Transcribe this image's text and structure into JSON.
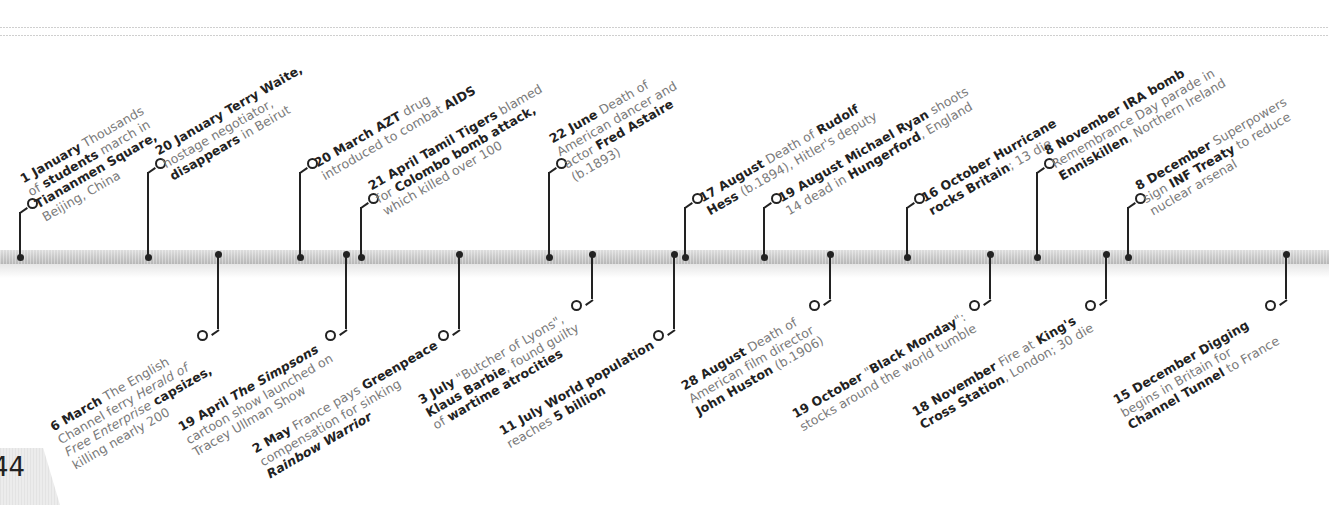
{
  "page": {
    "number": "44",
    "year_context": "1987"
  },
  "colors": {
    "band": "#c9c9c9",
    "pin": "#222222",
    "bold_text": "#222222",
    "body_text": "#7a7a7a"
  },
  "events_above": [
    {
      "date": "1 January",
      "lines": [
        [
          {
            "t": "1 January",
            "b": true
          },
          {
            "t": " Thousands"
          }
        ],
        [
          {
            "t": "of "
          },
          {
            "t": "students",
            "b": true
          },
          {
            "t": " march in"
          }
        ],
        [
          {
            "t": "Tiananmen Square,",
            "b": true
          }
        ],
        [
          {
            "t": "Beijing, China"
          }
        ]
      ],
      "x": 20
    },
    {
      "date": "20 January",
      "lines": [
        [
          {
            "t": "20 January Terry Waite,",
            "b": true
          }
        ],
        [
          {
            "t": "hostage negotiator,"
          }
        ],
        [
          {
            "t": "disappears",
            "b": true
          },
          {
            "t": " in Beirut"
          }
        ]
      ],
      "x": 148
    },
    {
      "date": "20 March",
      "lines": [
        [
          {
            "t": "20 March AZT",
            "b": true
          },
          {
            "t": " drug"
          }
        ],
        [
          {
            "t": "introduced to combat "
          },
          {
            "t": "AIDS",
            "b": true
          }
        ]
      ],
      "x": 300
    },
    {
      "date": "21 April",
      "lines": [
        [
          {
            "t": "21 April Tamil Tigers",
            "b": true
          },
          {
            "t": " blamed"
          }
        ],
        [
          {
            "t": "for "
          },
          {
            "t": "Colombo bomb attack,",
            "b": true
          }
        ],
        [
          {
            "t": "which killed over 100"
          }
        ]
      ],
      "x": 361
    },
    {
      "date": "22 June",
      "lines": [
        [
          {
            "t": "22 June",
            "b": true
          },
          {
            "t": " Death of"
          }
        ],
        [
          {
            "t": "American dancer and"
          }
        ],
        [
          {
            "t": "actor "
          },
          {
            "t": "Fred Astaire",
            "b": true
          }
        ],
        [
          {
            "t": "(b.1893)"
          }
        ]
      ],
      "x": 549
    },
    {
      "date": "17 August",
      "lines": [
        [
          {
            "t": "17 August",
            "b": true
          },
          {
            "t": " Death of "
          },
          {
            "t": "Rudolf",
            "b": true
          }
        ],
        [
          {
            "t": "Hess",
            "b": true
          },
          {
            "t": " (b.1894), Hitler's deputy"
          }
        ]
      ],
      "x": 685
    },
    {
      "date": "19 August",
      "lines": [
        [
          {
            "t": "19 August Michael Ryan",
            "b": true
          },
          {
            "t": " shoots"
          }
        ],
        [
          {
            "t": "14 dead in "
          },
          {
            "t": "Hungerford",
            "b": true
          },
          {
            "t": ", England"
          }
        ]
      ],
      "x": 764
    },
    {
      "date": "16 October",
      "lines": [
        [
          {
            "t": "16 October Hurricane",
            "b": true
          }
        ],
        [
          {
            "t": "rocks Britain",
            "b": true
          },
          {
            "t": "; 13 die"
          }
        ]
      ],
      "x": 907
    },
    {
      "date": "8 November",
      "lines": [
        [
          {
            "t": "8 November IRA bomb",
            "b": true
          }
        ],
        [
          {
            "t": "Remembrance Day parade in"
          }
        ],
        [
          {
            "t": "Enniskillen",
            "b": true
          },
          {
            "t": ", Northern Ireland"
          }
        ]
      ],
      "x": 1037
    },
    {
      "date": "8 December",
      "lines": [
        [
          {
            "t": "8 December",
            "b": true
          },
          {
            "t": " Superpowers"
          }
        ],
        [
          {
            "t": "sign "
          },
          {
            "t": "INF Treaty",
            "b": true
          },
          {
            "t": " to reduce"
          }
        ],
        [
          {
            "t": "nuclear arsenal"
          }
        ]
      ],
      "x": 1128
    }
  ],
  "events_below": [
    {
      "date": "6 March",
      "lines": [
        [
          {
            "t": "6 March",
            "b": true
          },
          {
            "t": " The English"
          }
        ],
        [
          {
            "t": "Channel ferry "
          },
          {
            "t": "Herald of",
            "i": true
          }
        ],
        [
          {
            "t": "Free Enterprise",
            "i": true
          },
          {
            "t": " capsizes,",
            "b": true
          }
        ],
        [
          {
            "t": "killing nearly 200"
          }
        ]
      ],
      "x": 218
    },
    {
      "date": "19 April",
      "lines": [
        [
          {
            "t": "19 April ",
            "b": true
          },
          {
            "t": "The Simpsons",
            "b": true,
            "i": true
          }
        ],
        [
          {
            "t": "cartoon show launched on"
          }
        ],
        [
          {
            "t": "Tracey Ullman Show"
          }
        ]
      ],
      "x": 346
    },
    {
      "date": "2 May",
      "lines": [
        [
          {
            "t": "2 May",
            "b": true
          },
          {
            "t": " France pays "
          },
          {
            "t": "Greenpeace",
            "b": true
          }
        ],
        [
          {
            "t": "compensation for sinking"
          }
        ],
        [
          {
            "t": "Rainbow Warrior",
            "b": true,
            "i": true
          }
        ]
      ],
      "x": 459
    },
    {
      "date": "3 July",
      "lines": [
        [
          {
            "t": "3 July",
            "b": true
          },
          {
            "t": " \"Butcher of Lyons\","
          }
        ],
        [
          {
            "t": "Klaus Barbie",
            "b": true
          },
          {
            "t": ", found guilty"
          }
        ],
        [
          {
            "t": "of "
          },
          {
            "t": "wartime atrocities",
            "b": true
          }
        ]
      ],
      "x": 592
    },
    {
      "date": "11 July",
      "lines": [
        [
          {
            "t": "11 July World population",
            "b": true
          }
        ],
        [
          {
            "t": "reaches "
          },
          {
            "t": "5 billion",
            "b": true
          }
        ]
      ],
      "x": 674
    },
    {
      "date": "28 August",
      "lines": [
        [
          {
            "t": "28 August",
            "b": true
          },
          {
            "t": " Death of"
          }
        ],
        [
          {
            "t": "American film director"
          }
        ],
        [
          {
            "t": "John Huston",
            "b": true
          },
          {
            "t": " (b.1906)"
          }
        ]
      ],
      "x": 830
    },
    {
      "date": "19 October",
      "lines": [
        [
          {
            "t": "19 October",
            "b": true
          },
          {
            "t": " \""
          },
          {
            "t": "Black Monday",
            "b": true
          },
          {
            "t": "\":"
          }
        ],
        [
          {
            "t": "stocks around the world tumble"
          }
        ]
      ],
      "x": 990
    },
    {
      "date": "18 November",
      "lines": [
        [
          {
            "t": "18 November",
            "b": true
          },
          {
            "t": " Fire at "
          },
          {
            "t": "King's",
            "b": true
          }
        ],
        [
          {
            "t": "Cross Station",
            "b": true
          },
          {
            "t": ", London; 30 die"
          }
        ]
      ],
      "x": 1106
    },
    {
      "date": "15 December",
      "lines": [
        [
          {
            "t": "15 December Digging",
            "b": true
          }
        ],
        [
          {
            "t": "begins in Britain for"
          }
        ],
        [
          {
            "t": "Channel Tunnel",
            "b": true
          },
          {
            "t": " to France"
          }
        ]
      ],
      "x": 1286
    }
  ]
}
